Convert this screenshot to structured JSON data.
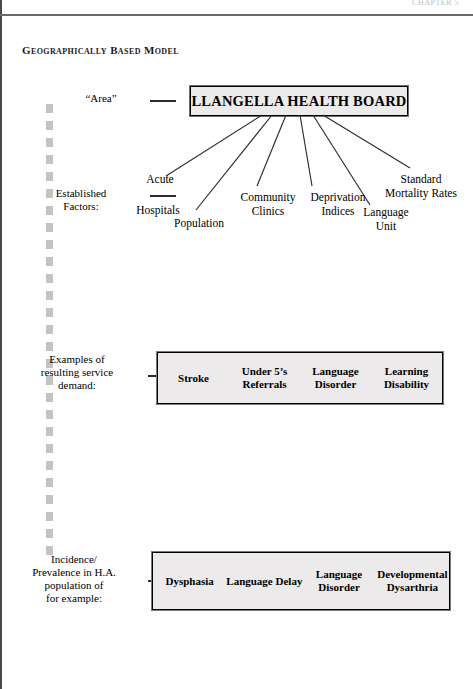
{
  "page": {
    "running_header": "CHAPTER 5",
    "figure_title": "Geographically Based Model"
  },
  "board": {
    "title": "LLANGELLA HEALTH BOARD"
  },
  "stages": [
    {
      "id": "area",
      "lines": [
        "“Area”"
      ]
    },
    {
      "id": "established-factors",
      "lines": [
        "Established",
        "Factors:"
      ]
    },
    {
      "id": "service-demand",
      "lines": [
        "Examples of",
        "resulting service",
        "demand:"
      ]
    },
    {
      "id": "incidence-prevalence",
      "lines": [
        "Incidence/",
        "Prevalence in H.A.",
        "population of",
        "for example:"
      ]
    }
  ],
  "factors": [
    {
      "id": "acute",
      "lines": [
        "Acute"
      ]
    },
    {
      "id": "hospitals",
      "lines": [
        "Hospitals"
      ]
    },
    {
      "id": "population",
      "lines": [
        "Population"
      ]
    },
    {
      "id": "community-clinics",
      "lines": [
        "Community",
        "Clinics"
      ]
    },
    {
      "id": "deprivation-indices",
      "lines": [
        "Deprivation",
        "Indices"
      ]
    },
    {
      "id": "language-unit",
      "lines": [
        "Language",
        "Unit"
      ]
    },
    {
      "id": "standard-mortality-rates",
      "lines": [
        "Standard",
        "Mortality Rates"
      ]
    }
  ],
  "demand_box": {
    "cells": [
      {
        "id": "stroke",
        "lines": [
          "Stroke"
        ]
      },
      {
        "id": "under-5s-referrals",
        "lines": [
          "Under 5’s",
          "Referrals"
        ]
      },
      {
        "id": "language-disorder",
        "lines": [
          "Language",
          "Disorder"
        ]
      },
      {
        "id": "learning-disability",
        "lines": [
          "Learning",
          "Disability"
        ]
      }
    ]
  },
  "incidence_box": {
    "cells": [
      {
        "id": "dysphasia",
        "lines": [
          "Dysphasia"
        ]
      },
      {
        "id": "language-delay",
        "lines": [
          "Language Delay"
        ]
      },
      {
        "id": "language-disorder",
        "lines": [
          "Language",
          "Disorder"
        ]
      },
      {
        "id": "developmental-dysarthria",
        "lines": [
          "Developmental",
          "Dysarthria"
        ]
      }
    ]
  },
  "colors": {
    "box_fill": "#eceaea",
    "box_border": "#000000",
    "spine_dash": "#c3c3c3",
    "line": "#2b2b2b",
    "text": "#000000"
  }
}
